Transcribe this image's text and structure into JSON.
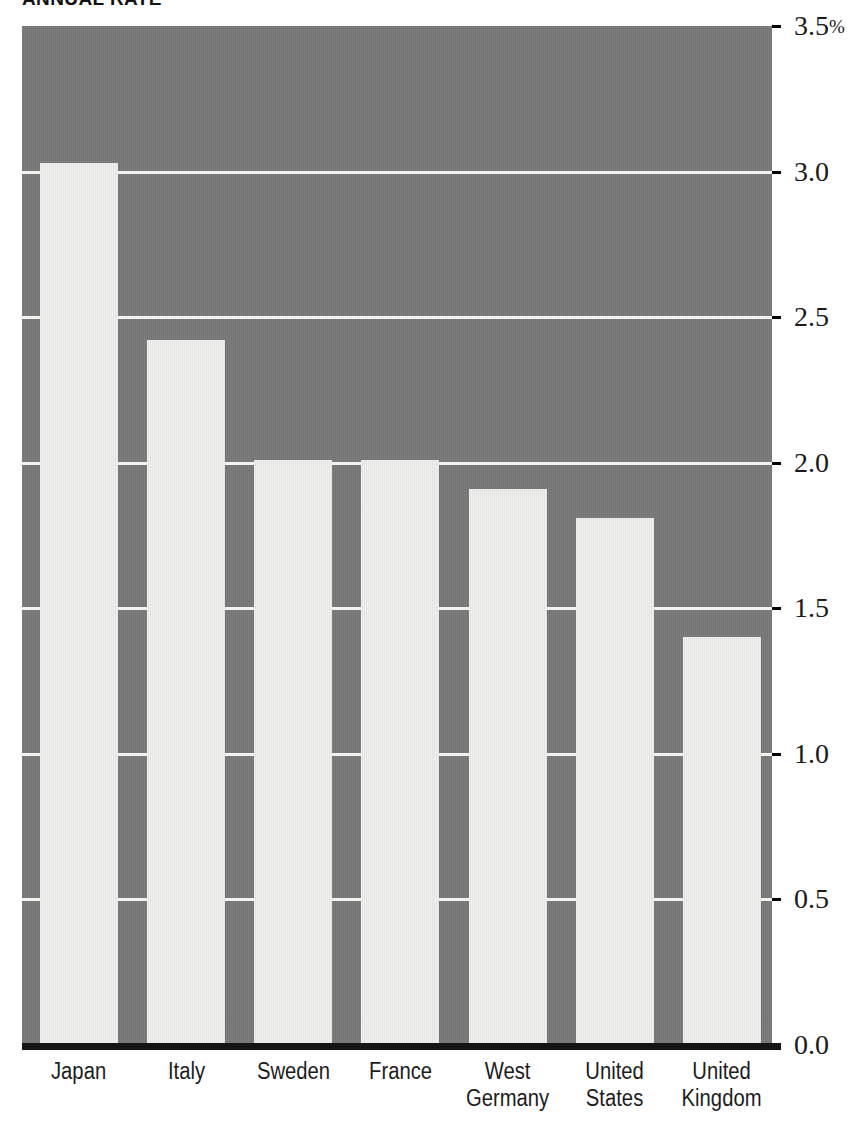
{
  "chart_data": {
    "type": "bar",
    "title": "ANNUAL RATE",
    "xlabel": "",
    "ylabel": "",
    "ylim": [
      0.0,
      3.5
    ],
    "grid": true,
    "legend": null,
    "unit": "%",
    "categories": [
      "Japan",
      "Italy",
      "Sweden",
      "France",
      "West\nGermany",
      "United\nStates",
      "United\nKingdom"
    ],
    "values": [
      3.03,
      2.42,
      2.01,
      2.01,
      1.91,
      1.81,
      1.4
    ],
    "ytick_labels": [
      "3.5%",
      "3.0",
      "2.5",
      "2.0",
      "1.5",
      "1.0",
      "0.5",
      "0.0"
    ],
    "ytick_values": [
      3.5,
      3.0,
      2.5,
      2.0,
      1.5,
      1.0,
      0.5,
      0.0
    ],
    "colors": {
      "plot_background": "#787878",
      "bar_fill": "#e9e9e7",
      "gridline": "#f2f2f0",
      "axis_line": "#141414",
      "text": "#1a1a1a",
      "page_background": "#ffffff"
    }
  }
}
